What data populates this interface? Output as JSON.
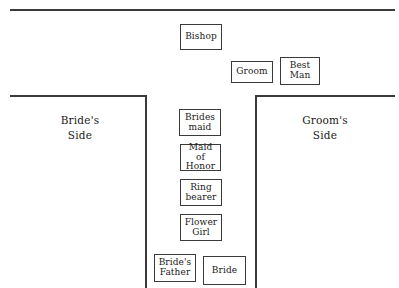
{
  "diagram": {
    "line_color": "#3a3a3a",
    "background": "#ffffff",
    "labels": {
      "brides_side": "Bride's\nSide",
      "grooms_side": "Groom's\nSide"
    },
    "boxes": [
      {
        "key": "bishop",
        "label": "Bishop"
      },
      {
        "key": "groom",
        "label": "Groom"
      },
      {
        "key": "best_man",
        "label": "Best\nMan"
      },
      {
        "key": "bridesmaid",
        "label": "Brides\nmaid"
      },
      {
        "key": "maid_of_honor",
        "label": "Maid of\nHonor"
      },
      {
        "key": "ring_bearer",
        "label": "Ring\nbearer"
      },
      {
        "key": "flower_girl",
        "label": "Flower\nGirl"
      },
      {
        "key": "brides_father",
        "label": "Bride's\nFather"
      },
      {
        "key": "bride",
        "label": "Bride"
      }
    ]
  }
}
